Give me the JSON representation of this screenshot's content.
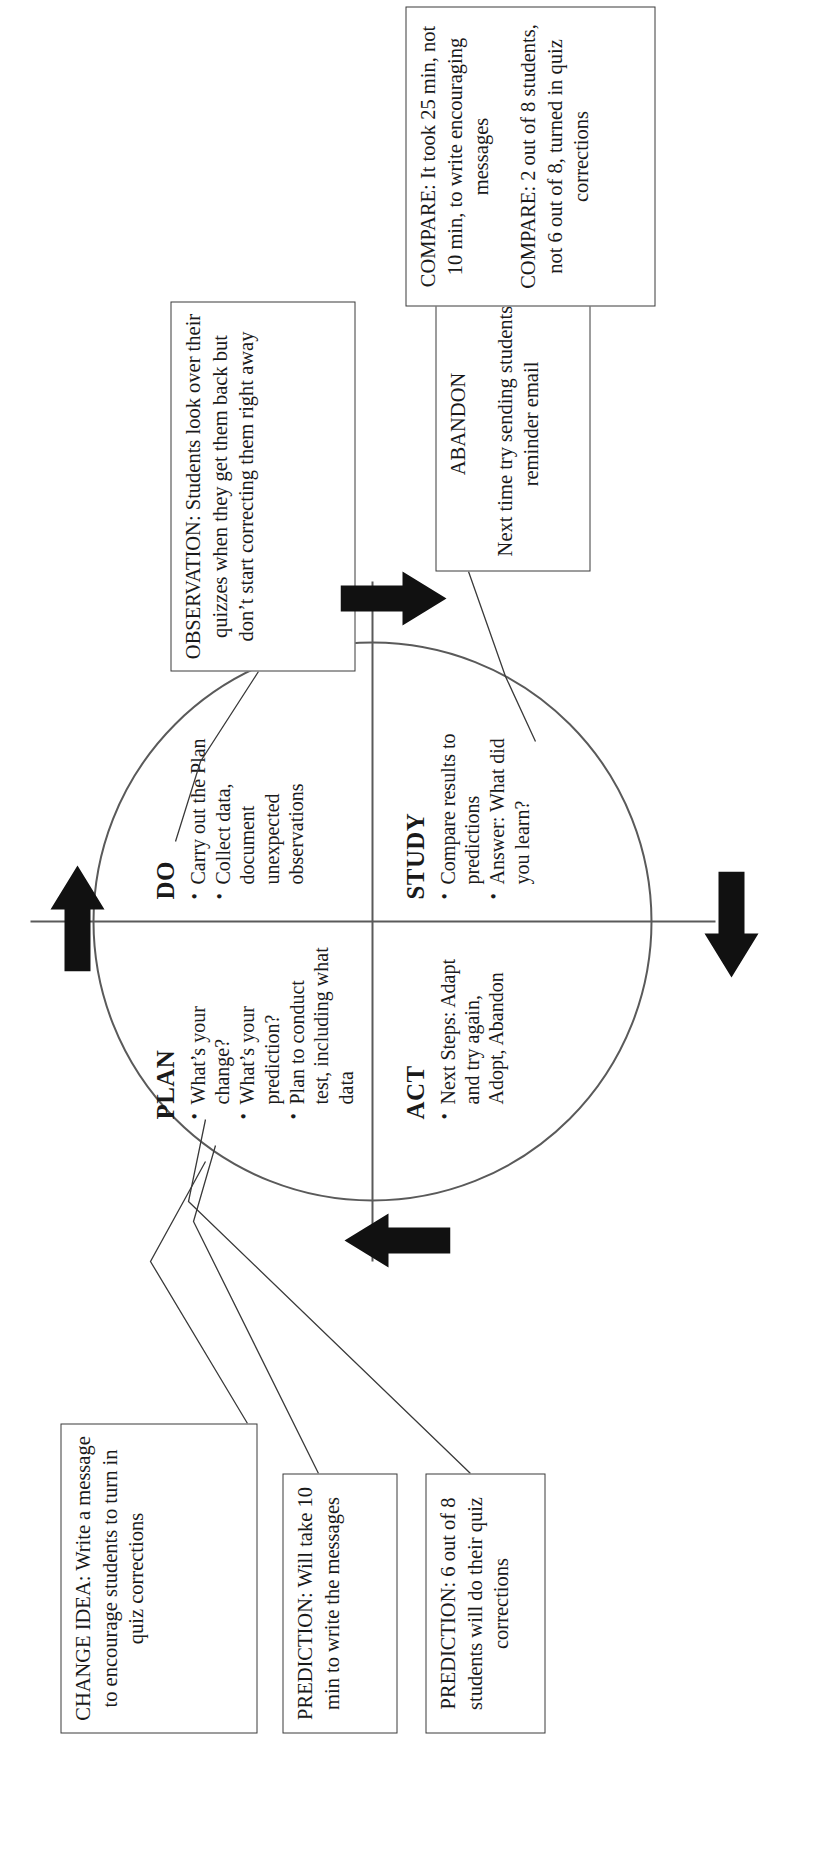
{
  "diagram": {
    "type": "pdsa-cycle",
    "orientation": "rotated-90-ccw"
  },
  "quadrants": [
    {
      "key": "plan",
      "title": "PLAN",
      "bullets": [
        "What’s your change?",
        "What’s your prediction?",
        "Plan to conduct test, including what data"
      ]
    },
    {
      "key": "do",
      "title": "DO",
      "bullets": [
        "Carry out the Plan",
        "Collect data, document unexpected observations"
      ]
    },
    {
      "key": "study",
      "title": "STUDY",
      "bullets": [
        "Compare results to predictions",
        "Answer: What did you learn?"
      ]
    },
    {
      "key": "act",
      "title": "ACT",
      "bullets": [
        "Next Steps: Adapt and try again, Adopt, Abandon"
      ]
    }
  ],
  "callouts": {
    "change_idea": {
      "lines": [
        "CHANGE IDEA: Write a message to encourage students to turn in quiz corrections"
      ]
    },
    "prediction_1": {
      "lines": [
        "PREDICTION: Will take 10 min to write the messages"
      ]
    },
    "prediction_2": {
      "lines": [
        "PREDICTION: 6 out of 8 students will do their quiz corrections"
      ]
    },
    "observation": {
      "lines": [
        "OBSERVATION: Students look over their quizzes when they get them back but don’t start correcting them right away"
      ]
    },
    "abandon": {
      "lines": [
        "ABANDON",
        "Next time try sending students a reminder email"
      ]
    },
    "compare": {
      "lines": [
        "COMPARE: It took 25 min, not 10 min, to write encouraging messages",
        "COMPARE: 2 out of 8 students, not 6 out of 8, turned in quiz corrections"
      ]
    }
  },
  "colors": {
    "stroke": "#5a5a5a",
    "box_stroke": "#3a3a3a",
    "arrow_fill": "#111111",
    "text": "#1a1a1a",
    "background": "#ffffff"
  }
}
